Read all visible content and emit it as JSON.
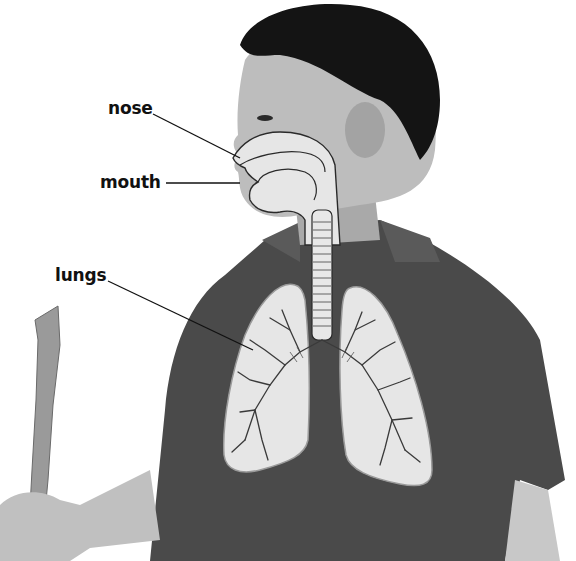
{
  "diagram": {
    "labels": [
      {
        "id": "nose",
        "text": "nose",
        "x": 108,
        "y": 98,
        "line": {
          "x1": 153,
          "y1": 114,
          "x2": 240,
          "y2": 158
        }
      },
      {
        "id": "mouth",
        "text": "mouth",
        "x": 100,
        "y": 172,
        "line": {
          "x1": 166,
          "y1": 183,
          "x2": 240,
          "y2": 183
        }
      },
      {
        "id": "lungs",
        "text": "lungs",
        "x": 55,
        "y": 265,
        "line": {
          "x1": 108,
          "y1": 281,
          "x2": 253,
          "y2": 350
        }
      }
    ],
    "colors": {
      "background": "#ffffff",
      "label_text": "#111111",
      "shirt": "#4a4a4a",
      "skin": "#bdbdbd",
      "hair": "#141414",
      "organ_fill": "#e6e6e6",
      "organ_outline": "#2a2a2a",
      "recorder": "#9a9a9a"
    }
  }
}
